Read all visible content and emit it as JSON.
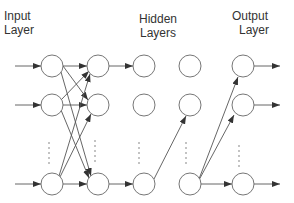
{
  "labels": {
    "input": [
      "Input",
      "Layer"
    ],
    "hidden": [
      "Hidden",
      "Layers"
    ],
    "output": [
      "Output",
      "Layer"
    ]
  },
  "layers": [
    {
      "name": "input",
      "x": 52
    },
    {
      "name": "hidden-1",
      "x": 98
    },
    {
      "name": "hidden-2",
      "x": 144
    },
    {
      "name": "hidden-3",
      "x": 190
    },
    {
      "name": "output",
      "x": 243
    }
  ],
  "rows": [
    66,
    105,
    184
  ],
  "node_radius": 11,
  "colors": {
    "stroke": "#555555",
    "text": "#333333",
    "background": "#ffffff"
  }
}
